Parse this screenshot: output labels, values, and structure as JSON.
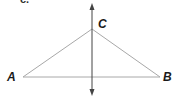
{
  "figure": {
    "part_label": "c.",
    "points": {
      "A": {
        "label": "A",
        "x": 23,
        "y": 77
      },
      "B": {
        "label": "B",
        "x": 160,
        "y": 77
      },
      "C": {
        "label": "C",
        "x": 92,
        "y": 29
      }
    },
    "perpendicular_line": {
      "x": 92,
      "y_top": 5,
      "y_bottom": 95,
      "arrows": "both"
    },
    "colors": {
      "triangle_stroke": "#a8a8a8",
      "axis_stroke": "#444444",
      "label": "#1a1a1a"
    }
  }
}
